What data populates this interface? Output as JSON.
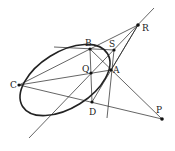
{
  "diagram": {
    "points": {
      "A": {
        "label": "A",
        "x": 111,
        "y": 70
      },
      "B": {
        "label": "B",
        "x": 90,
        "y": 49
      },
      "C": {
        "label": "C",
        "x": 19,
        "y": 85
      },
      "D": {
        "label": "D",
        "x": 92,
        "y": 102
      },
      "P": {
        "label": "P",
        "x": 162,
        "y": 119
      },
      "Q": {
        "label": "Q",
        "x": 91,
        "y": 73
      },
      "R": {
        "label": "R",
        "x": 138,
        "y": 25
      },
      "S": {
        "label": "S",
        "x": 114,
        "y": 50
      }
    },
    "ellipse": {
      "cx": 65,
      "cy": 80,
      "rx": 50,
      "ry": 28,
      "rotate": -32
    },
    "colors": {
      "stroke": "#222222",
      "background": "#ffffff"
    }
  }
}
